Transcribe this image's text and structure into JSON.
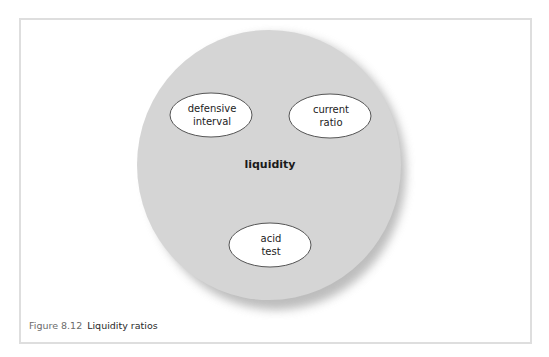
{
  "figure": {
    "number": "Figure 8.12",
    "title": "Liquidity ratios"
  },
  "diagram": {
    "center": {
      "label": "liquidity",
      "fill": "#d5d5d5"
    },
    "nodes": [
      {
        "id": "defensive-interval",
        "lines": [
          "defensive",
          "interval"
        ]
      },
      {
        "id": "current-ratio",
        "lines": [
          "current",
          "ratio"
        ]
      },
      {
        "id": "acid-test",
        "lines": [
          "acid",
          "test"
        ]
      }
    ],
    "colors": {
      "frame_border": "#dedede",
      "outer_fill": "#d5d5d5",
      "node_fill": "#ffffff",
      "node_stroke": "#555555",
      "shadow": "#9a9a9a"
    }
  }
}
